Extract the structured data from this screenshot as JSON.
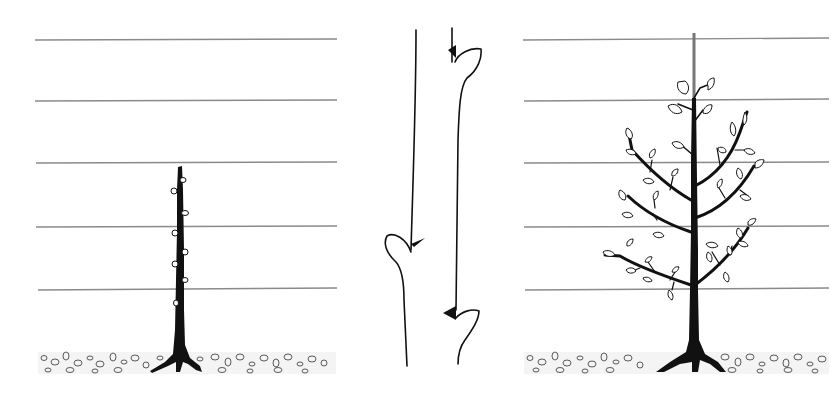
{
  "figure": {
    "colors": {
      "ink": "#111111",
      "wire": "#8a8a8a",
      "stake": "#777777",
      "background": "#ffffff"
    },
    "panels": [
      {
        "id": "maiden-whip",
        "label": "",
        "wires_y": [
          40,
          101,
          163,
          227,
          290
        ],
        "wire_x": [
          35,
          337
        ],
        "trunk_x": 180,
        "trunk_top_y": 166,
        "ground_y": [
          352,
          374
        ],
        "bud_count": 8
      },
      {
        "id": "pruning-cut-detail",
        "label": "",
        "stems": [
          {
            "x_top": 416,
            "x_bottom": 407,
            "top_y": 30,
            "bottom_y": 366,
            "bud_y": 240
          },
          {
            "x_top": 452,
            "x_bottom": 456,
            "top_y": 28,
            "bottom_y": 364,
            "bud_y": 50,
            "bud2_y": 313
          }
        ]
      },
      {
        "id": "feathered-tree",
        "label": "",
        "wires_y": [
          40,
          101,
          163,
          227,
          290
        ],
        "wire_x": [
          523,
          829
        ],
        "trunk_x": 693,
        "stake_top_y": 33,
        "ground_y": [
          352,
          374
        ],
        "branch_tiers": 3
      }
    ]
  }
}
